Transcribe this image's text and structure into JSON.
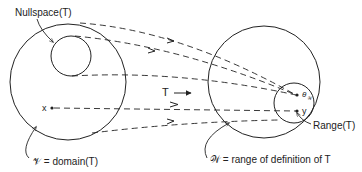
{
  "diagram": {
    "labels": {
      "nullspace": "Nullspace(T)",
      "mapping": "T",
      "x_point": "x",
      "y_point": "y",
      "theta_point": "θ",
      "theta_sub": "𝒲",
      "range": "Range(T)",
      "domain": "𝒱 = domain(T)",
      "range_definition": "𝒲 = range of definition of T"
    },
    "colors": {
      "stroke": "#222222",
      "background": "#ffffff"
    }
  }
}
